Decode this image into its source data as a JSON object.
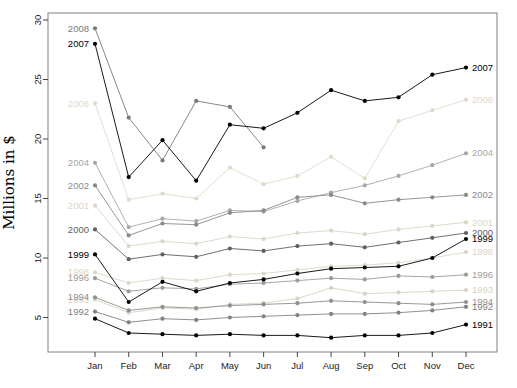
{
  "figure": {
    "background": "#ffffff",
    "frame_color": "#808080"
  },
  "chart_data": {
    "type": "line",
    "title": "",
    "xlabel": "",
    "ylabel": "Millions in $",
    "x_categories": [
      "Jan",
      "Feb",
      "Mar",
      "Apr",
      "May",
      "Jun",
      "Jul",
      "Aug",
      "Sep",
      "Oct",
      "Nov",
      "Dec"
    ],
    "yticks": [
      5,
      10,
      15,
      20,
      25,
      30
    ],
    "ylim": [
      2.1,
      30.7
    ],
    "grid": false,
    "legend": "year labels at line start (Jan) and line end (Dec)",
    "series": [
      {
        "name": "2006",
        "color": "#e0dacb",
        "label_left": true,
        "label_right": true,
        "values": [
          23.0,
          14.9,
          15.4,
          15.0,
          17.6,
          16.2,
          16.9,
          18.5,
          16.7,
          21.5,
          22.4,
          23.3
        ]
      },
      {
        "name": "2001",
        "color": "#dcd6c6",
        "label_left": true,
        "label_right": true,
        "values": [
          14.4,
          11.0,
          11.4,
          11.2,
          11.8,
          11.6,
          12.1,
          12.3,
          12.0,
          12.4,
          12.7,
          13.0
        ]
      },
      {
        "name": "1998",
        "color": "#dcd6c6",
        "label_left": true,
        "label_right": true,
        "values": [
          8.8,
          7.9,
          8.3,
          8.1,
          8.6,
          8.7,
          9.0,
          9.3,
          9.4,
          9.6,
          10.0,
          10.5
        ]
      },
      {
        "name": "1993",
        "color": "#d9d3c3",
        "label_left": true,
        "label_right": true,
        "values": [
          6.5,
          5.4,
          5.8,
          5.7,
          6.1,
          6.2,
          6.6,
          7.5,
          7.0,
          7.1,
          7.2,
          7.3
        ]
      },
      {
        "name": "2004",
        "color": "#a8a8a8",
        "label_left": true,
        "label_right": true,
        "values": [
          18.0,
          12.6,
          13.3,
          13.1,
          14.0,
          13.9,
          14.8,
          15.5,
          16.1,
          16.9,
          17.8,
          18.8
        ]
      },
      {
        "name": "1996",
        "color": "#9c9c9c",
        "label_left": true,
        "label_right": true,
        "values": [
          8.3,
          7.2,
          7.5,
          7.4,
          7.8,
          7.9,
          8.1,
          8.3,
          8.2,
          8.5,
          8.4,
          8.6
        ]
      },
      {
        "name": "1994",
        "color": "#8f8f8f",
        "label_left": true,
        "label_right": true,
        "values": [
          6.7,
          5.6,
          5.9,
          5.8,
          6.0,
          6.1,
          6.2,
          6.4,
          6.3,
          6.2,
          6.1,
          6.3
        ]
      },
      {
        "name": "2002",
        "color": "#8a8a8a",
        "label_left": true,
        "label_right": true,
        "values": [
          16.1,
          11.9,
          12.9,
          12.8,
          13.8,
          14.0,
          15.1,
          15.3,
          14.6,
          14.9,
          15.1,
          15.3
        ]
      },
      {
        "name": "1992",
        "color": "#828282",
        "label_left": true,
        "label_right": true,
        "values": [
          5.5,
          4.6,
          4.9,
          4.8,
          5.0,
          5.1,
          5.2,
          5.3,
          5.3,
          5.4,
          5.6,
          5.9
        ]
      },
      {
        "name": "2008",
        "color": "#7a7a7a",
        "label_left": true,
        "label_right": false,
        "values": [
          29.3,
          21.8,
          18.2,
          23.2,
          22.7,
          19.3,
          null,
          null,
          null,
          null,
          null,
          null
        ]
      },
      {
        "name": "2000",
        "color": "#606060",
        "label_left": true,
        "label_right": true,
        "values": [
          12.4,
          9.9,
          10.3,
          10.1,
          10.8,
          10.6,
          11.0,
          11.2,
          10.9,
          11.3,
          11.7,
          12.1
        ]
      },
      {
        "name": "1999",
        "color": "#000000",
        "label_left": true,
        "label_right": true,
        "values": [
          10.3,
          6.3,
          8.0,
          7.2,
          7.9,
          8.2,
          8.7,
          9.1,
          9.2,
          9.3,
          10.0,
          11.6
        ]
      },
      {
        "name": "1991",
        "color": "#000000",
        "label_left": false,
        "label_right": true,
        "values": [
          4.9,
          3.7,
          3.6,
          3.5,
          3.6,
          3.5,
          3.5,
          3.3,
          3.5,
          3.5,
          3.7,
          4.4
        ]
      },
      {
        "name": "2007",
        "color": "#000000",
        "label_left": true,
        "label_right": true,
        "values": [
          28.0,
          16.8,
          19.9,
          16.5,
          21.2,
          20.9,
          22.2,
          24.1,
          23.2,
          23.5,
          25.4,
          26.0
        ]
      }
    ]
  }
}
